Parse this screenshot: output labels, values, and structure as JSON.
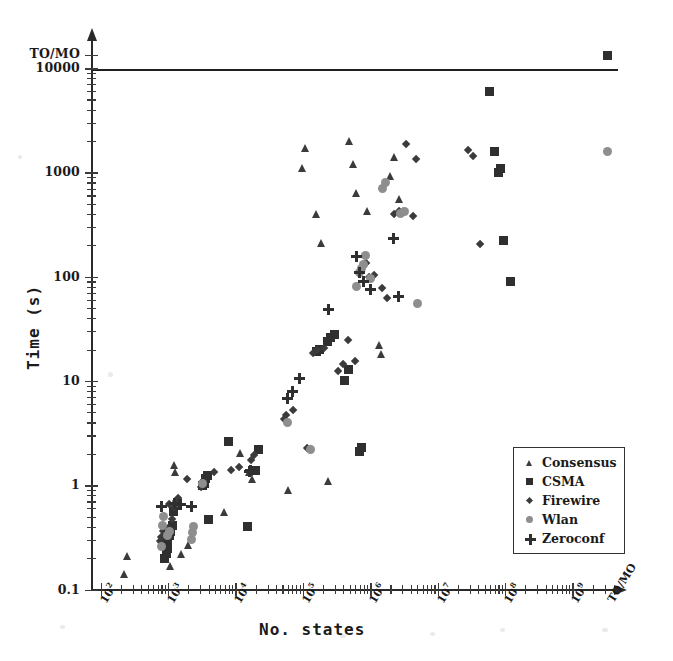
{
  "chart_data": {
    "type": "scatter",
    "title": "",
    "xlabel": "No. states",
    "ylabel": "Time (s)",
    "xscale": "log",
    "yscale": "log",
    "xlim": [
      100,
      2000000000
    ],
    "ylim": [
      0.1,
      10000
    ],
    "grid": false,
    "legend_position": "lower-right",
    "x_tick_labels": [
      "10²",
      "10³",
      "10⁴",
      "10⁵",
      "10⁶",
      "10⁷",
      "10⁸",
      "10⁹",
      "TO/MO"
    ],
    "x_tick_bases": [
      2,
      3,
      4,
      5,
      6,
      7,
      8,
      9
    ],
    "x_tick_overflow_label": "TO/MO",
    "y_tick_labels": [
      "0.1",
      "1",
      "10",
      "100",
      "1000",
      "10000",
      "TO/MO"
    ],
    "y_tick_values": [
      0.1,
      1,
      10,
      100,
      1000,
      10000
    ],
    "y_tick_overflow_label": "TO/MO",
    "cutoff_line_value": 10000,
    "annotations": [
      {
        "text": "TO/MO",
        "axis": "y",
        "note": "timeout / memory-out band above 10000 s"
      },
      {
        "text": "TO/MO",
        "axis": "x",
        "note": "timeout / memory-out state count"
      }
    ],
    "series": [
      {
        "name": "Consensus",
        "marker": "triangle",
        "color": "#3b3b3b",
        "points": [
          [
            230,
            0.14
          ],
          [
            250,
            0.21
          ],
          [
            820,
            0.3
          ],
          [
            900,
            0.33
          ],
          [
            1100,
            0.17
          ],
          [
            1250,
            1.55
          ],
          [
            1300,
            1.35
          ],
          [
            1600,
            0.22
          ],
          [
            2000,
            0.27
          ],
          [
            7000,
            0.55
          ],
          [
            12000,
            2.05
          ],
          [
            16000,
            1.35
          ],
          [
            18000,
            1.15
          ],
          [
            62000,
            0.9
          ],
          [
            100000,
            1100
          ],
          [
            110000,
            1700
          ],
          [
            160000,
            400
          ],
          [
            190000,
            210
          ],
          [
            240000,
            1.1
          ],
          [
            500000,
            2000
          ],
          [
            560000,
            1200
          ],
          [
            620000,
            640
          ],
          [
            900000,
            430
          ],
          [
            1400000,
            22
          ],
          [
            1450000,
            18
          ],
          [
            2000000,
            930
          ],
          [
            2300000,
            1400
          ],
          [
            2700000,
            560
          ],
          [
            3100000,
            430
          ]
        ]
      },
      {
        "name": "CSMA",
        "marker": "square",
        "color": "#2f2f2f",
        "points": [
          [
            900,
            0.2
          ],
          [
            950,
            0.22
          ],
          [
            980,
            0.25
          ],
          [
            1000,
            0.3
          ],
          [
            1050,
            0.33
          ],
          [
            1100,
            0.36
          ],
          [
            1150,
            0.41
          ],
          [
            1200,
            0.56
          ],
          [
            3300,
            1.0
          ],
          [
            3500,
            1.05
          ],
          [
            3600,
            1.15
          ],
          [
            3800,
            1.25
          ],
          [
            4000,
            0.47
          ],
          [
            8000,
            2.6
          ],
          [
            15000,
            0.4
          ],
          [
            20000,
            1.4
          ],
          [
            22000,
            2.2
          ],
          [
            160000,
            19
          ],
          [
            180000,
            20
          ],
          [
            230000,
            24
          ],
          [
            260000,
            26
          ],
          [
            300000,
            28
          ],
          [
            420000,
            10
          ],
          [
            480000,
            13
          ],
          [
            700000,
            2.1
          ],
          [
            750000,
            2.3
          ],
          [
            60000000,
            6000
          ],
          [
            70000000,
            1600
          ],
          [
            80000000,
            1000
          ],
          [
            85000000,
            1100
          ],
          [
            95000000,
            220
          ],
          [
            120000000,
            90
          ],
          [
            1200000000,
            20000
          ]
        ]
      },
      {
        "name": "Firewire",
        "marker": "diamond",
        "color": "#3b3b3b",
        "points": [
          [
            800,
            0.28
          ],
          [
            830,
            0.31
          ],
          [
            880,
            0.35
          ],
          [
            1000,
            0.33
          ],
          [
            1050,
            0.38
          ],
          [
            1100,
            0.64
          ],
          [
            1200,
            0.46
          ],
          [
            1300,
            0.6
          ],
          [
            1400,
            0.68
          ],
          [
            1500,
            0.73
          ],
          [
            2000,
            1.1
          ],
          [
            3300,
            0.93
          ],
          [
            5000,
            1.3
          ],
          [
            9000,
            1.35
          ],
          [
            12000,
            1.45
          ],
          [
            18000,
            1.7
          ],
          [
            20000,
            1.9
          ],
          [
            55000,
            4.2
          ],
          [
            60000,
            4.6
          ],
          [
            75000,
            5.1
          ],
          [
            120000,
            2.2
          ],
          [
            150000,
            18
          ],
          [
            170000,
            19
          ],
          [
            220000,
            20
          ],
          [
            350000,
            12
          ],
          [
            420000,
            14
          ],
          [
            500000,
            24
          ],
          [
            620000,
            15
          ],
          [
            900000,
            130
          ],
          [
            1000000,
            95
          ],
          [
            1200000,
            100
          ],
          [
            1600000,
            75
          ],
          [
            1900000,
            60
          ],
          [
            2400000,
            390
          ],
          [
            2800000,
            410
          ],
          [
            3600000,
            1800
          ],
          [
            4500000,
            370
          ],
          [
            5000000,
            1300
          ],
          [
            30000000,
            1600
          ],
          [
            35000000,
            1400
          ],
          [
            45000000,
            200
          ]
        ]
      },
      {
        "name": "Wlan",
        "marker": "circle",
        "color": "#8e8e8e",
        "points": [
          [
            800,
            0.26
          ],
          [
            830,
            0.41
          ],
          [
            850,
            0.5
          ],
          [
            1000,
            0.33
          ],
          [
            1050,
            0.36
          ],
          [
            2200,
            0.3
          ],
          [
            2300,
            0.35
          ],
          [
            2400,
            0.4
          ],
          [
            3300,
            1.05
          ],
          [
            60000,
            4.0
          ],
          [
            130000,
            2.2
          ],
          [
            620000,
            80
          ],
          [
            700000,
            110
          ],
          [
            750000,
            120
          ],
          [
            800000,
            130
          ],
          [
            850000,
            160
          ],
          [
            1000000,
            95
          ],
          [
            1500000,
            700
          ],
          [
            1700000,
            800
          ],
          [
            2800000,
            400
          ],
          [
            3200000,
            420
          ],
          [
            5000000,
            55
          ],
          [
            2000000000,
            1600
          ]
        ]
      },
      {
        "name": "Zeroconf",
        "marker": "plus",
        "color": "#2f2f2f",
        "points": [
          [
            800,
            0.62
          ],
          [
            1250,
            0.67
          ],
          [
            1500,
            0.65
          ],
          [
            1550,
            0.66
          ],
          [
            2200,
            0.63
          ],
          [
            16000,
            1.35
          ],
          [
            17000,
            1.4
          ],
          [
            60000,
            6.8
          ],
          [
            70000,
            8.0
          ],
          [
            90000,
            10.5
          ],
          [
            240000,
            48
          ],
          [
            620000,
            155
          ],
          [
            700000,
            110
          ],
          [
            800000,
            90
          ],
          [
            1000000,
            75
          ],
          [
            2200000,
            230
          ],
          [
            2600000,
            65
          ]
        ]
      }
    ]
  },
  "legend": {
    "entries": [
      {
        "label": "Consensus",
        "marker": "triangle"
      },
      {
        "label": "CSMA",
        "marker": "square"
      },
      {
        "label": "Firewire",
        "marker": "diamond"
      },
      {
        "label": "Wlan",
        "marker": "circle"
      },
      {
        "label": "Zeroconf",
        "marker": "plus"
      }
    ]
  }
}
